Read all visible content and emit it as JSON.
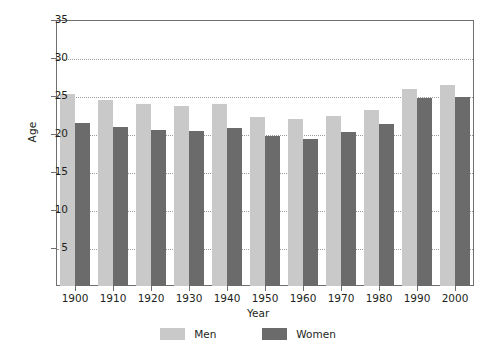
{
  "chart_data": {
    "type": "bar",
    "title": "",
    "xlabel": "Year",
    "ylabel": "Age",
    "categories": [
      "1900",
      "1910",
      "1920",
      "1930",
      "1940",
      "1950",
      "1960",
      "1970",
      "1980",
      "1990",
      "2000"
    ],
    "series": [
      {
        "name": "Men",
        "color": "#c9c9c9",
        "values": [
          25.3,
          24.5,
          24.0,
          23.7,
          23.9,
          22.2,
          22.0,
          22.4,
          23.1,
          25.9,
          26.5
        ]
      },
      {
        "name": "Women",
        "color": "#6b6b6b",
        "values": [
          21.4,
          20.9,
          20.5,
          20.4,
          20.8,
          19.8,
          19.4,
          20.2,
          21.3,
          24.8,
          24.9
        ]
      }
    ],
    "ylim": [
      0,
      35
    ],
    "yticks": [
      5,
      10,
      15,
      20,
      25,
      30,
      35
    ],
    "ytick_labels": [
      "5",
      "10",
      "15",
      "20",
      "25",
      "30",
      "35"
    ],
    "grid": true,
    "grid_axis": "y",
    "legend_position": "bottom",
    "legend_entries": [
      "Men",
      "Women"
    ]
  }
}
